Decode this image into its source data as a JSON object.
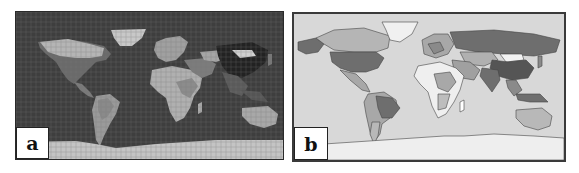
{
  "figure": {
    "panels": [
      {
        "id": "a",
        "label": "a",
        "description": "World map with dark ocean, light land and grid overlay",
        "colors": {
          "ocean": "#3e3e3e",
          "land_light": "#b8b8b8",
          "land_mid": "#8a8a8a",
          "land_dark": "#2a2a2a",
          "grid": "#6a6a6a",
          "antarctica": "#c4c4c4"
        }
      },
      {
        "id": "b",
        "label": "b",
        "description": "World choropleth map with country shading in grayscale",
        "colors": {
          "ocean": "#d8d8d8",
          "land_light": "#efefef",
          "land_mid": "#a8a8a8",
          "land_dark": "#6e6e6e",
          "border": "#444444",
          "antarctica": "#eeeeee"
        }
      }
    ]
  }
}
